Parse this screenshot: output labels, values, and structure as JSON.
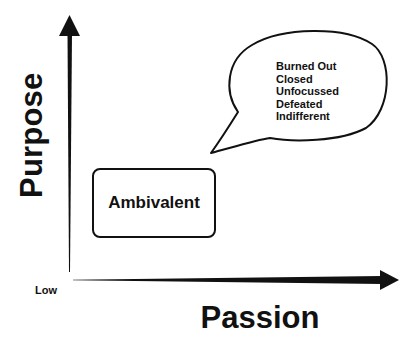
{
  "diagram": {
    "axes": {
      "y_label": "Purpose",
      "x_label": "Passion",
      "origin_label": "Low"
    },
    "box": {
      "label": "Ambivalent"
    },
    "speech_bubble": {
      "items": [
        "Burned Out",
        "Closed",
        "Unfocussed",
        "Defeated",
        "Indifferent"
      ]
    },
    "colors": {
      "ink": "#111111",
      "background": "#ffffff"
    }
  }
}
